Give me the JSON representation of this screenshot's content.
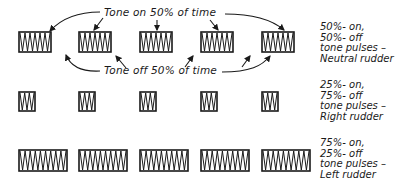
{
  "annotations": {
    "tone_on": "Tone on 50% of time",
    "tone_off": "Tone off 50% of time"
  },
  "rows": [
    {
      "name": "neutral",
      "description": [
        "50%- on,",
        "50%- off",
        "tone pulses –",
        "Neutral rudder"
      ],
      "pulse_on_percent": 50,
      "pulse_off_percent": 50,
      "pulse_count": 5
    },
    {
      "name": "right",
      "description": [
        "25%- on,",
        "75%- off",
        "tone pulses –",
        "Right rudder"
      ],
      "pulse_on_percent": 25,
      "pulse_off_percent": 75,
      "pulse_count": 5
    },
    {
      "name": "left",
      "description": [
        "75%- on,",
        "25%- off",
        "tone pulses –",
        "Left rudder"
      ],
      "pulse_on_percent": 75,
      "pulse_off_percent": 25,
      "pulse_count": 5
    }
  ],
  "colors": {
    "ink": "#1a1a1a",
    "background": "#ffffff"
  }
}
